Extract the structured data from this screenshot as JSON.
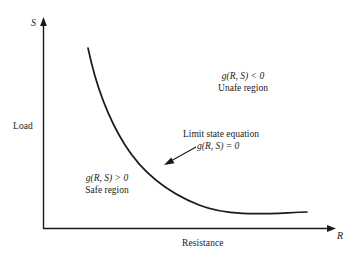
{
  "figure": {
    "type": "diagram",
    "background_color": "#ffffff",
    "line_color": "#1a1a1a",
    "text_color": "#1a1a1a"
  },
  "axes": {
    "y_axis": {
      "variable": "S",
      "name": "Load",
      "arrow": "up"
    },
    "x_axis": {
      "variable": "R",
      "name": "Resistance",
      "arrow": "right"
    },
    "origin": {
      "x": 43,
      "y": 228
    }
  },
  "curve": {
    "name": "limit-state-curve",
    "shape": "hyperbolic-decay",
    "start": {
      "x": 88,
      "y": 48
    },
    "end": {
      "x": 307,
      "y": 212
    }
  },
  "annotations": {
    "unsafe": {
      "equation": "g(R, S) < 0",
      "caption": "Unafe region"
    },
    "safe": {
      "equation": "g(R, S) > 0",
      "caption": "Safe region"
    },
    "limit_state": {
      "caption": "Limit state equation",
      "equation": "g(R, S) = 0",
      "pointer": {
        "from": {
          "x": 196,
          "y": 147
        },
        "to": {
          "x": 165,
          "y": 164
        }
      }
    }
  }
}
